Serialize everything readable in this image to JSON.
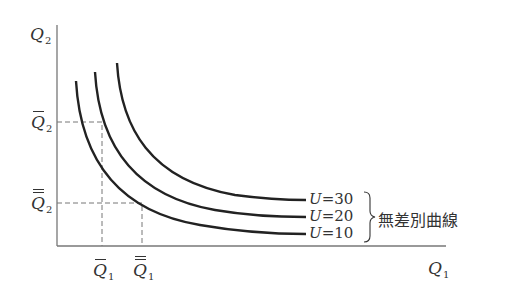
{
  "diagram": {
    "type": "indifference-curves",
    "axes": {
      "y_label": "Q",
      "y_label_sub": "2",
      "x_label": "Q",
      "x_label_sub": "1"
    },
    "ticks": {
      "q2_bar": {
        "base": "Q",
        "sub": "2",
        "marks": "single-bar"
      },
      "q2_double_bar": {
        "base": "Q",
        "sub": "2",
        "marks": "double-bar"
      },
      "q1_bar": {
        "base": "Q",
        "sub": "1",
        "marks": "single-bar"
      },
      "q1_double_bar": {
        "base": "Q",
        "sub": "1",
        "marks": "double-bar"
      }
    },
    "curves": [
      {
        "label": "U=30",
        "u_symbol": "U",
        "u_value": "=30"
      },
      {
        "label": "U=20",
        "u_symbol": "U",
        "u_value": "=20"
      },
      {
        "label": "U=10",
        "u_symbol": "U",
        "u_value": "=10"
      }
    ],
    "brace_label": "無差別曲線",
    "colors": {
      "curve": "#222222",
      "axis": "#777777",
      "dashed": "#777777",
      "text": "#333333"
    }
  }
}
